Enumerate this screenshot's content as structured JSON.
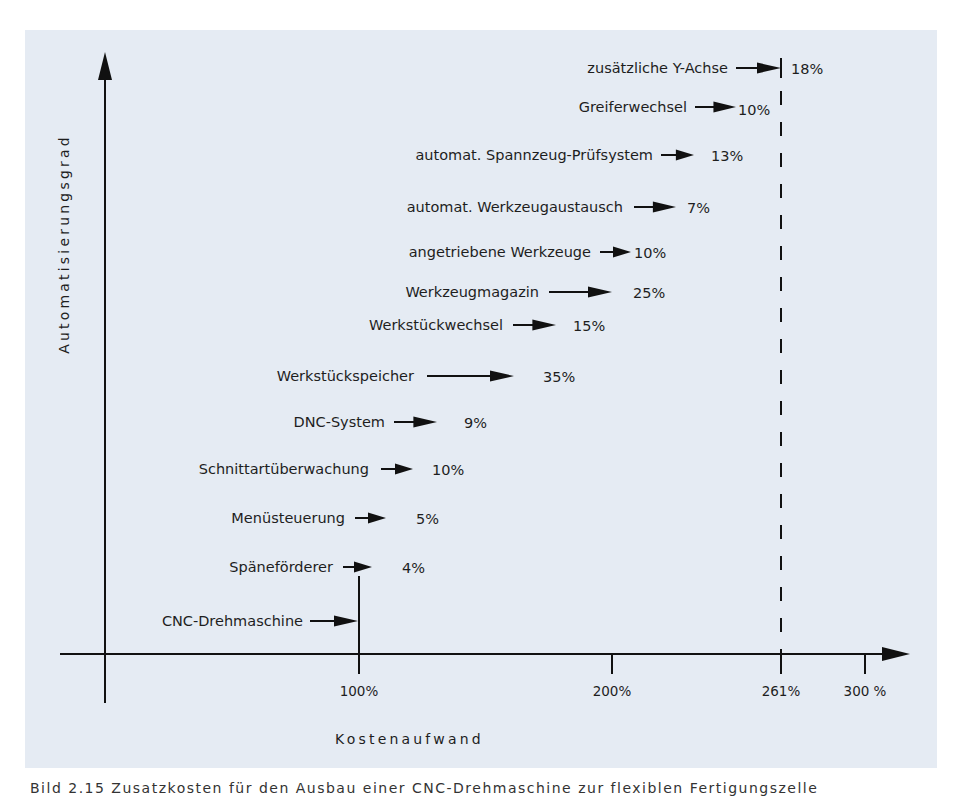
{
  "chart": {
    "y_axis_title": "Automatisierungsgrad",
    "x_axis_title": "Kostenaufwand",
    "x_ticks": [
      {
        "label": "100%",
        "x": 359
      },
      {
        "label": "200%",
        "x": 612
      },
      {
        "label": "261%",
        "x": 781
      },
      {
        "label": "300 %",
        "x": 865
      }
    ],
    "rows": [
      {
        "label": "zusätzliche Y-Achse",
        "value": "18%",
        "y": 68,
        "label_right": 728,
        "arrow_start": 736,
        "arrow_end": 781,
        "value_x": 791
      },
      {
        "label": "Greiferwechsel",
        "value": "10%",
        "y": 107,
        "label_right": 687,
        "arrow_start": 695,
        "arrow_end": 736,
        "value_x": 738
      },
      {
        "label": "automat. Spannzeug-Prüfsystem",
        "value": "13%",
        "y": 155,
        "label_right": 653,
        "arrow_start": 661,
        "arrow_end": 694,
        "value_x": 711
      },
      {
        "label": "automat. Werkzeugaustausch",
        "value": "7%",
        "y": 207,
        "label_right": 623,
        "arrow_start": 634,
        "arrow_end": 676,
        "value_x": 687
      },
      {
        "label": "angetriebene Werkzeuge",
        "value": "10%",
        "y": 252,
        "label_right": 591,
        "arrow_start": 600,
        "arrow_end": 631,
        "value_x": 634
      },
      {
        "label": "Werkzeugmagazin",
        "value": "25%",
        "y": 292,
        "label_right": 539,
        "arrow_start": 549,
        "arrow_end": 612,
        "value_x": 633
      },
      {
        "label": "Werkstückwechsel",
        "value": "15%",
        "y": 325,
        "label_right": 503,
        "arrow_start": 513,
        "arrow_end": 556,
        "value_x": 573
      },
      {
        "label": "Werkstückspeicher",
        "value": "35%",
        "y": 376,
        "label_right": 414,
        "arrow_start": 427,
        "arrow_end": 514,
        "value_x": 543
      },
      {
        "label": "DNC-System",
        "value": "9%",
        "y": 422,
        "label_right": 385,
        "arrow_start": 394,
        "arrow_end": 437,
        "value_x": 464
      },
      {
        "label": "Schnittartüberwachung",
        "value": "10%",
        "y": 469,
        "label_right": 369,
        "arrow_start": 381,
        "arrow_end": 413,
        "value_x": 432
      },
      {
        "label": "Menüsteuerung",
        "value": "5%",
        "y": 518,
        "label_right": 345,
        "arrow_start": 355,
        "arrow_end": 386,
        "value_x": 416
      },
      {
        "label": "Späneförderer",
        "value": "4%",
        "y": 567,
        "label_right": 333,
        "arrow_start": 343,
        "arrow_end": 372,
        "value_x": 402
      },
      {
        "label": "CNC-Drehmaschine",
        "value": "",
        "y": 621,
        "label_right": 303,
        "arrow_start": 310,
        "arrow_end": 358,
        "value_x": 0
      }
    ],
    "colors": {
      "panel_bg": "#e5ebf3",
      "ink": "#111111"
    }
  },
  "caption": "Bild 2.15  Zusatzkosten für den Ausbau einer CNC-Drehmaschine zur flexiblen Fertigungszelle",
  "chart_data": {
    "type": "bar",
    "xlabel": "Kostenaufwand",
    "ylabel": "Automatisierungsgrad",
    "orientation": "horizontal-cumulative",
    "base": {
      "label": "CNC-Drehmaschine",
      "value": 100
    },
    "categories": [
      "Späneförderer",
      "Menüsteuerung",
      "Schnittartüberwachung",
      "DNC-System",
      "Werkstückspeicher",
      "Werkstückwechsel",
      "Werkzeugmagazin",
      "angetriebene Werkzeuge",
      "automat. Werkzeugaustausch",
      "automat. Spannzeug-Prüfsystem",
      "Greiferwechsel",
      "zusätzliche Y-Achse"
    ],
    "values": [
      4,
      5,
      10,
      9,
      35,
      15,
      25,
      10,
      7,
      13,
      10,
      18
    ],
    "unit": "%",
    "total": 261,
    "x_ticks": [
      "100%",
      "200%",
      "261%",
      "300 %"
    ],
    "xlim": [
      0,
      310
    ],
    "annotations": [
      "dashed vertical line at 261%"
    ],
    "grid": false,
    "legend": null
  }
}
